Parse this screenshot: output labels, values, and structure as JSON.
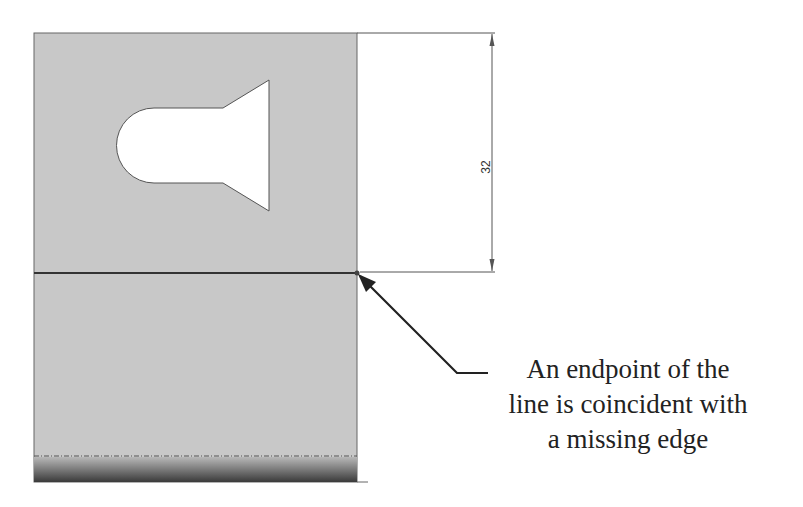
{
  "diagram": {
    "dimension": {
      "value": "32",
      "orientation": "vertical"
    },
    "callout": {
      "lines": [
        "An endpoint of the",
        "line is coincident with",
        "a missing edge"
      ]
    },
    "colors": {
      "part_fill": "#c8c8c8",
      "edge": "#555555",
      "leader": "#222222"
    }
  }
}
